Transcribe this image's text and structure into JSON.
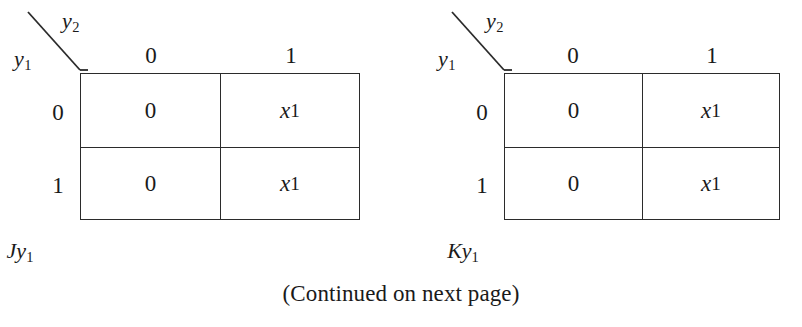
{
  "figure": {
    "note": "(Continued on next page)",
    "line_color": "#2b2b2b",
    "text_color": "#1a1a1a",
    "background": "#ffffff"
  },
  "maps": [
    {
      "id": "jy1",
      "caption_base": "Jy",
      "caption_sub": "1",
      "col_var_base": "y",
      "col_var_sub": "2",
      "row_var_base": "y",
      "row_var_sub": "1",
      "col_headers": [
        "0",
        "1"
      ],
      "row_headers": [
        "0",
        "1"
      ],
      "cells": [
        [
          {
            "base": "0",
            "sub": ""
          },
          {
            "base": "x",
            "sub": "1"
          }
        ],
        [
          {
            "base": "0",
            "sub": ""
          },
          {
            "base": "x",
            "sub": "1"
          }
        ]
      ]
    },
    {
      "id": "ky1",
      "caption_base": "Ky",
      "caption_sub": "1",
      "col_var_base": "y",
      "col_var_sub": "2",
      "row_var_base": "y",
      "row_var_sub": "1",
      "col_headers": [
        "0",
        "1"
      ],
      "row_headers": [
        "0",
        "1"
      ],
      "cells": [
        [
          {
            "base": "0",
            "sub": ""
          },
          {
            "base": "x",
            "sub": "1"
          }
        ],
        [
          {
            "base": "0",
            "sub": ""
          },
          {
            "base": "x",
            "sub": "1"
          }
        ]
      ]
    }
  ]
}
